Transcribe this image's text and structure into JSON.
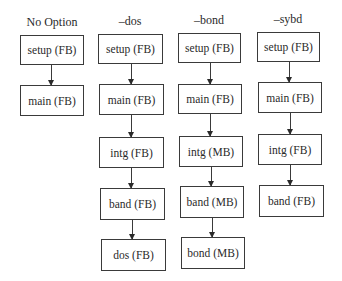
{
  "diagram": {
    "type": "flowchart-columns",
    "columns": [
      {
        "header": "No Option",
        "steps": [
          "setup (FB)",
          "main (FB)"
        ]
      },
      {
        "header": "–dos",
        "steps": [
          "setup (FB)",
          "main (FB)",
          "intg (FB)",
          "band (FB)",
          "dos (FB)"
        ]
      },
      {
        "header": "–bond",
        "steps": [
          "setup (FB)",
          "main (FB)",
          "intg (MB)",
          "band (MB)",
          "bond (MB)"
        ]
      },
      {
        "header": "–sybd",
        "steps": [
          "setup (FB)",
          "main (FB)",
          "intg (FB)",
          "band (FB)"
        ]
      }
    ],
    "colors": {
      "line": "#3a3a3a",
      "text": "#2a2a2a",
      "background": "#ffffff"
    }
  }
}
